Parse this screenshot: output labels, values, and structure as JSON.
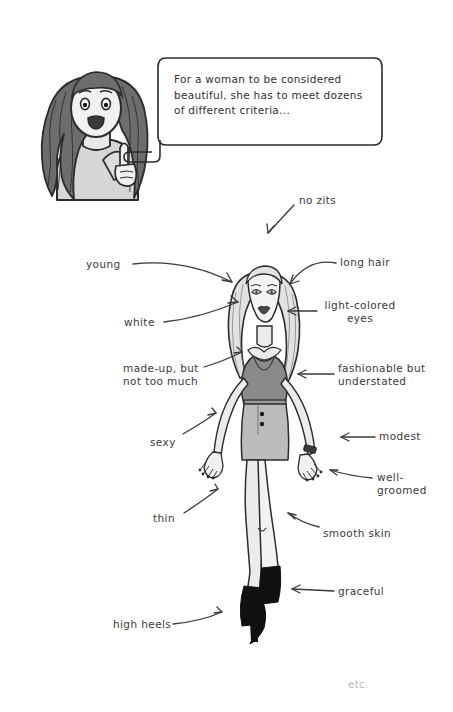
{
  "comic": {
    "speech_bubble": {
      "text": "For a woman to be considered\nbeautiful, she has to meet dozens\nof different criteria..."
    },
    "footer_note": "etc.",
    "palette": {
      "ink": "#2b2b2b",
      "paper": "#ffffff",
      "skin": "#ebebeb",
      "hair_light": "#e2e2e2",
      "hair_dark": "#6d6d6d",
      "top_dark": "#8a8a8a",
      "skirt_gray": "#bcbcbc",
      "boots_black": "#111111",
      "etc_gray": "#b9b9b9"
    },
    "annotations": [
      {
        "id": "no-zits",
        "label": "no zits",
        "x": 299,
        "y": 200,
        "align": "left"
      },
      {
        "id": "young",
        "label": "young",
        "x": 86,
        "y": 258,
        "align": "left"
      },
      {
        "id": "long-hair",
        "label": "long hair",
        "x": 340,
        "y": 257,
        "align": "left"
      },
      {
        "id": "white",
        "label": "white",
        "x": 124,
        "y": 316,
        "align": "left"
      },
      {
        "id": "light-eyes",
        "label": "light-colored\neyes",
        "x": 321,
        "y": 298,
        "align": "left"
      },
      {
        "id": "made-up",
        "label": "made-up, but\nnot too much",
        "x": 123,
        "y": 363,
        "align": "left"
      },
      {
        "id": "fashionable",
        "label": "fashionable but\nunderstated",
        "x": 338,
        "y": 362,
        "align": "left"
      },
      {
        "id": "sexy",
        "label": "sexy",
        "x": 150,
        "y": 436,
        "align": "left"
      },
      {
        "id": "modest",
        "label": "modest",
        "x": 379,
        "y": 430,
        "align": "left"
      },
      {
        "id": "well-groomed",
        "label": "well-\ngroomed",
        "x": 377,
        "y": 471,
        "align": "left"
      },
      {
        "id": "thin",
        "label": "thin",
        "x": 153,
        "y": 512,
        "align": "left"
      },
      {
        "id": "smooth-skin",
        "label": "smooth skin",
        "x": 323,
        "y": 527,
        "align": "left"
      },
      {
        "id": "graceful",
        "label": "graceful",
        "x": 338,
        "y": 588,
        "align": "left"
      },
      {
        "id": "high-heels",
        "label": "high heels",
        "x": 113,
        "y": 620,
        "align": "left"
      }
    ]
  }
}
